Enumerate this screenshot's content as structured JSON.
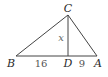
{
  "figure": {
    "line_color": "#444444",
    "vertices": {
      "B": {
        "label": "B",
        "x": 16,
        "y": 56
      },
      "A": {
        "label": "A",
        "x": 97,
        "y": 56
      },
      "C": {
        "label": "C",
        "x": 68,
        "y": 15
      },
      "D": {
        "label": "D",
        "x": 68,
        "y": 56
      }
    },
    "segments": [
      {
        "from": "B",
        "to": "A"
      },
      {
        "from": "B",
        "to": "C"
      },
      {
        "from": "C",
        "to": "A"
      },
      {
        "from": "C",
        "to": "D"
      }
    ],
    "measures": {
      "BD": "16",
      "DA": "9",
      "CD": "x"
    }
  }
}
